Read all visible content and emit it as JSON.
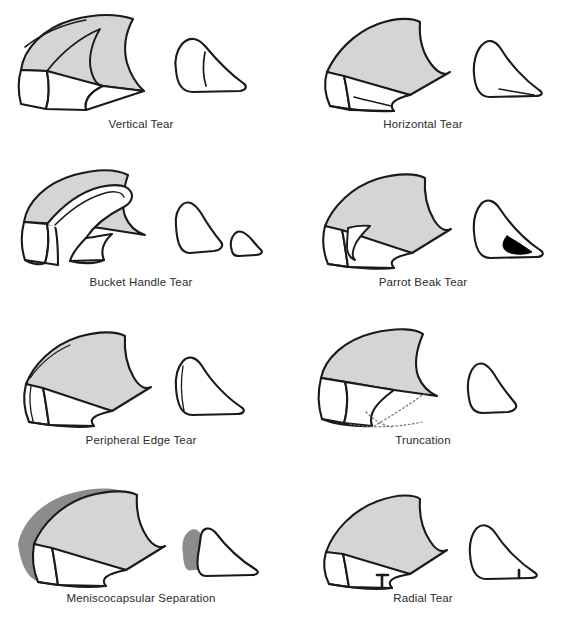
{
  "figure": {
    "columns": 2,
    "rows": 4,
    "background_color": "#ffffff"
  },
  "style": {
    "outline_color": "#1a1a1a",
    "body_fill": "#d5d5d5",
    "capsule_fill": "#8c8c8c",
    "defect_fill": "#000000",
    "white_fill": "#ffffff",
    "label_color": "#2b2b2b"
  },
  "panels": [
    {
      "id": "vertical-tear",
      "label": "Vertical Tear",
      "row": 1,
      "column": 1,
      "views": [
        "superior-oblique",
        "cross-section"
      ],
      "tear_marking": "vertical longitudinal split line running through the meniscal body and a short vertical line in the cross-section wedge"
    },
    {
      "id": "horizontal-tear",
      "label": "Horizontal Tear",
      "row": 1,
      "column": 2,
      "views": [
        "superior-oblique",
        "cross-section"
      ],
      "tear_marking": "horizontal cleavage line splitting the wedge into upper and lower leaves"
    },
    {
      "id": "bucket-handle-tear",
      "label": "Bucket Handle Tear",
      "row": 2,
      "column": 1,
      "views": [
        "superior-oblique",
        "cross-section"
      ],
      "tear_marking": "displaced inner fragment forming a handle; cross-section shows two separate fragments"
    },
    {
      "id": "parrot-beak-tear",
      "label": "Parrot Beak Tear",
      "row": 2,
      "column": 2,
      "views": [
        "superior-oblique",
        "cross-section"
      ],
      "tear_marking": "oblique flap resembling a parrot beak; solid black beak-shaped defect in cross-section"
    },
    {
      "id": "peripheral-edge-tear",
      "label": "Peripheral Edge Tear",
      "row": 3,
      "column": 1,
      "views": [
        "superior-oblique",
        "cross-section"
      ],
      "tear_marking": "thin split line paralleling the peripheral rim"
    },
    {
      "id": "truncation",
      "label": "Truncation",
      "row": 3,
      "column": 2,
      "views": [
        "superior-oblique",
        "cross-section"
      ],
      "tear_marking": "dotted arcs indicating the resected/absent anterior portion"
    },
    {
      "id": "meniscocapsular-separation",
      "label": "Meniscocapsular Separation",
      "row": 4,
      "column": 1,
      "views": [
        "superior-oblique",
        "cross-section"
      ],
      "tear_marking": "dark gray capsule detached along the peripheral margin"
    },
    {
      "id": "radial-tear",
      "label": "Radial Tear",
      "row": 4,
      "column": 2,
      "views": [
        "superior-oblique",
        "cross-section"
      ],
      "tear_marking": "black T-shaped radial cleft at the free inner edge"
    }
  ]
}
